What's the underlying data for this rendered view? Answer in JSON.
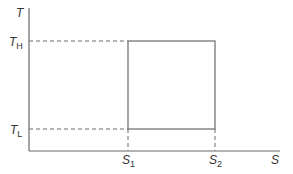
{
  "axes": {
    "y_label": "T",
    "x_label": "S"
  },
  "temperature_levels": [
    {
      "id": "high",
      "base": "T",
      "sub": "H"
    },
    {
      "id": "low",
      "base": "T",
      "sub": "L"
    }
  ],
  "entropy_levels": [
    {
      "id": "s1",
      "base": "S",
      "sub": "1"
    },
    {
      "id": "s2",
      "base": "S",
      "sub": "2"
    }
  ],
  "colors": {
    "line": "#6b6b6b",
    "text": "#333333"
  }
}
